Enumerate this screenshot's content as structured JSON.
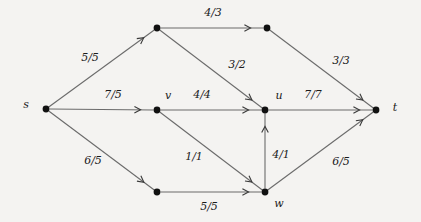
{
  "figure": {
    "background_color": "#f4f3f1",
    "node_color": "#111111",
    "edge_color": "#6b6b6b",
    "label_color": "#1a1a1a",
    "width": 421,
    "height": 222
  },
  "chart_data": {
    "type": "diagram",
    "subtype": "directed-flow-network",
    "title": "",
    "label_format": "capacity/flow",
    "nodes": [
      {
        "id": "s",
        "label": "s",
        "x": 46,
        "y": 109,
        "label_x": 26,
        "label_y": 105
      },
      {
        "id": "a",
        "label": "",
        "x": 157,
        "y": 28,
        "label_x": 157,
        "label_y": 28
      },
      {
        "id": "b",
        "label": "",
        "x": 267,
        "y": 28,
        "label_x": 267,
        "label_y": 28
      },
      {
        "id": "v",
        "label": "v",
        "x": 157,
        "y": 110,
        "label_x": 168,
        "label_y": 96
      },
      {
        "id": "u",
        "label": "u",
        "x": 265,
        "y": 110,
        "label_x": 279,
        "label_y": 96
      },
      {
        "id": "t",
        "label": "t",
        "x": 376,
        "y": 110,
        "label_x": 395,
        "label_y": 108
      },
      {
        "id": "c",
        "label": "",
        "x": 157,
        "y": 192,
        "label_x": 157,
        "label_y": 192
      },
      {
        "id": "w",
        "label": "w",
        "x": 265,
        "y": 192,
        "label_x": 279,
        "label_y": 204
      }
    ],
    "edges": [
      {
        "from": "s",
        "to": "a",
        "label": "5/5",
        "capacity": 5,
        "flow": 5,
        "label_x": 90,
        "label_y": 58
      },
      {
        "from": "a",
        "to": "b",
        "label": "4/3",
        "capacity": 4,
        "flow": 3,
        "label_x": 213,
        "label_y": 13
      },
      {
        "from": "b",
        "to": "t",
        "label": "3/3",
        "capacity": 3,
        "flow": 3,
        "label_x": 341,
        "label_y": 61
      },
      {
        "from": "a",
        "to": "u",
        "label": "3/2",
        "capacity": 3,
        "flow": 2,
        "label_x": 237,
        "label_y": 65
      },
      {
        "from": "s",
        "to": "v",
        "label": "7/5",
        "capacity": 7,
        "flow": 5,
        "label_x": 113,
        "label_y": 95
      },
      {
        "from": "v",
        "to": "u",
        "label": "4/4",
        "capacity": 4,
        "flow": 4,
        "label_x": 202,
        "label_y": 95
      },
      {
        "from": "u",
        "to": "t",
        "label": "7/7",
        "capacity": 7,
        "flow": 7,
        "label_x": 313,
        "label_y": 95
      },
      {
        "from": "s",
        "to": "c",
        "label": "6/5",
        "capacity": 6,
        "flow": 5,
        "label_x": 93,
        "label_y": 161
      },
      {
        "from": "v",
        "to": "w",
        "label": "1/1",
        "capacity": 1,
        "flow": 1,
        "label_x": 194,
        "label_y": 157
      },
      {
        "from": "w",
        "to": "u",
        "label": "4/1",
        "capacity": 4,
        "flow": 1,
        "label_x": 281,
        "label_y": 155
      },
      {
        "from": "c",
        "to": "w",
        "label": "5/5",
        "capacity": 5,
        "flow": 5,
        "label_x": 209,
        "label_y": 207
      },
      {
        "from": "w",
        "to": "t",
        "label": "6/5",
        "capacity": 6,
        "flow": 5,
        "label_x": 341,
        "label_y": 162
      }
    ]
  }
}
